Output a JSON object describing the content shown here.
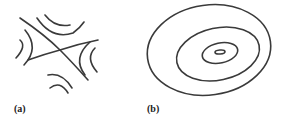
{
  "panels": [
    {
      "label": "(a)",
      "description": "saddle point contours"
    },
    {
      "label": "(b)",
      "description": "concentric elliptical contours (minimum)"
    }
  ],
  "colors": {
    "stroke": "#3a3a3a",
    "background": "#ffffff"
  }
}
